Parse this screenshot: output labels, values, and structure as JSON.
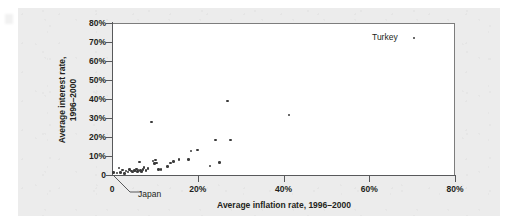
{
  "figure": {
    "background_color": "#ececec",
    "plot_background_color": "#ffffff",
    "axis_color": "#58595b",
    "marker_color": "#3a3a3a"
  },
  "chart_data": {
    "type": "scatter",
    "title": "",
    "xlabel": "Average inflation rate, 1996–2000",
    "ylabel": "Average interest rate, 1996–2000",
    "ylabel_lines": [
      "Average interest rate,",
      "1996–2000"
    ],
    "xlim": [
      0,
      80
    ],
    "ylim": [
      0,
      80
    ],
    "xticks": [
      0,
      20,
      40,
      60,
      80
    ],
    "xtick_labels": [
      "0",
      "20%",
      "40%",
      "60%",
      "80%"
    ],
    "yticks": [
      0,
      10,
      20,
      30,
      40,
      50,
      60,
      70,
      80
    ],
    "ytick_labels": [
      "0",
      "10%",
      "20%",
      "30%",
      "40%",
      "50%",
      "60%",
      "70%",
      "80%"
    ],
    "grid": false,
    "legend": null,
    "units": "percent",
    "annotations": [
      {
        "label": "Turkey",
        "x": 70.4,
        "y": 72.0,
        "text_anchor": "right-of-point"
      },
      {
        "label": "Japan",
        "x": 0.3,
        "y": 1.3,
        "text_anchor": "leader-line-below-left"
      }
    ],
    "points": [
      {
        "x": 0.3,
        "y": 1.3
      },
      {
        "x": 1.2,
        "y": 1.0
      },
      {
        "x": 1.6,
        "y": 3.6
      },
      {
        "x": 2.0,
        "y": 1.2
      },
      {
        "x": 2.4,
        "y": 2.6
      },
      {
        "x": 2.9,
        "y": 0.9
      },
      {
        "x": 3.3,
        "y": 2.0
      },
      {
        "x": 3.7,
        "y": 1.5
      },
      {
        "x": 4.1,
        "y": 3.0
      },
      {
        "x": 4.5,
        "y": 2.2
      },
      {
        "x": 4.8,
        "y": 1.6
      },
      {
        "x": 5.2,
        "y": 2.4
      },
      {
        "x": 5.4,
        "y": 2.1
      },
      {
        "x": 5.7,
        "y": 3.1
      },
      {
        "x": 5.9,
        "y": 1.8
      },
      {
        "x": 6.1,
        "y": 2.6
      },
      {
        "x": 6.4,
        "y": 6.9
      },
      {
        "x": 6.6,
        "y": 2.3
      },
      {
        "x": 6.9,
        "y": 1.9
      },
      {
        "x": 7.2,
        "y": 2.9
      },
      {
        "x": 7.5,
        "y": 4.1
      },
      {
        "x": 7.9,
        "y": 2.5
      },
      {
        "x": 8.4,
        "y": 3.3
      },
      {
        "x": 9.2,
        "y": 27.8
      },
      {
        "x": 9.6,
        "y": 7.4
      },
      {
        "x": 9.9,
        "y": 6.0
      },
      {
        "x": 10.1,
        "y": 8.0
      },
      {
        "x": 10.4,
        "y": 6.3
      },
      {
        "x": 10.8,
        "y": 3.0
      },
      {
        "x": 11.4,
        "y": 2.9
      },
      {
        "x": 13.0,
        "y": 4.5
      },
      {
        "x": 13.6,
        "y": 6.4
      },
      {
        "x": 14.4,
        "y": 7.1
      },
      {
        "x": 15.6,
        "y": 8.3
      },
      {
        "x": 17.8,
        "y": 8.3
      },
      {
        "x": 18.4,
        "y": 12.6
      },
      {
        "x": 20.0,
        "y": 13.2
      },
      {
        "x": 22.9,
        "y": 4.7
      },
      {
        "x": 24.2,
        "y": 18.5
      },
      {
        "x": 25.1,
        "y": 6.6
      },
      {
        "x": 26.9,
        "y": 39.0
      },
      {
        "x": 27.6,
        "y": 18.4
      },
      {
        "x": 41.3,
        "y": 31.6
      },
      {
        "x": 70.4,
        "y": 72.0
      }
    ]
  }
}
